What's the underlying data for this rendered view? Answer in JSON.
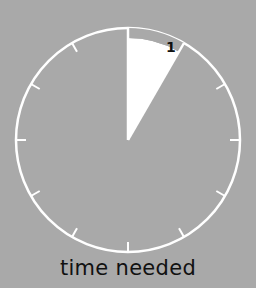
{
  "diagram": {
    "type": "clock-face",
    "caption": "time needed",
    "segment_label": "1",
    "segment_start_hour": 0,
    "segment_end_hour": 1,
    "tick_count": 12,
    "colors": {
      "background": "#a9a9a9",
      "face_line": "#ffffff",
      "segment_fill": "#ffffff",
      "text": "#111111"
    }
  }
}
